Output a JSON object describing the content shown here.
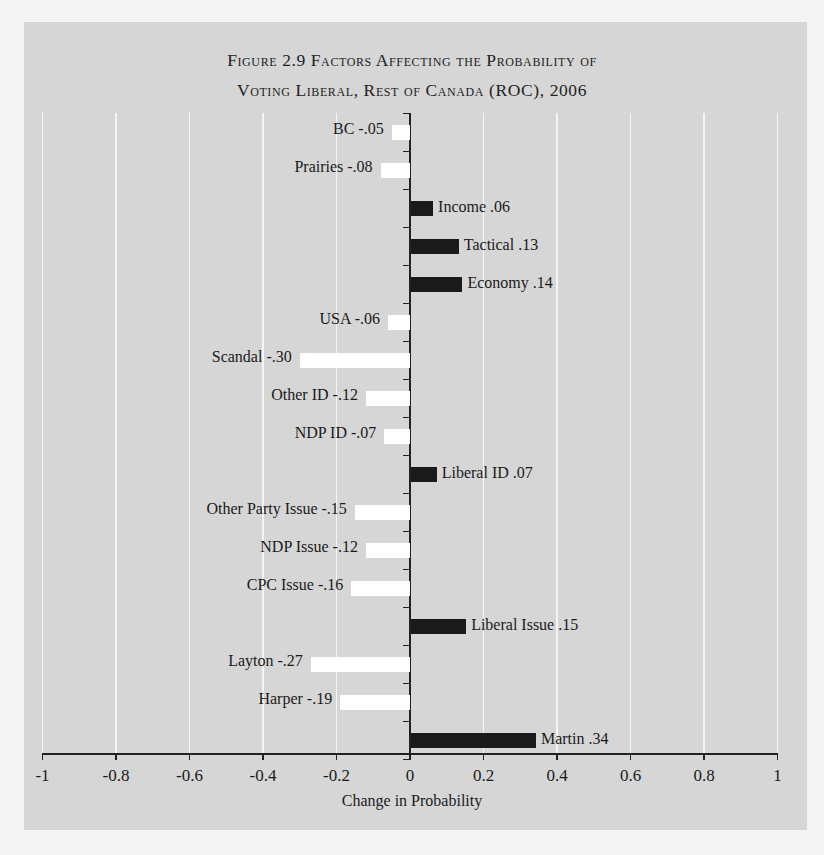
{
  "chart_data": {
    "type": "bar",
    "orientation": "horizontal",
    "title_lines": [
      "Figure 2.9 Factors Affecting the Probability of",
      "Voting Liberal, Rest of Canada (ROC), 2006"
    ],
    "xlabel": "Change in Probability",
    "ylabel": "",
    "xlim": [
      -1,
      1
    ],
    "x_ticks": [
      "-1",
      "-0.8",
      "-0.6",
      "-0.4",
      "-0.2",
      "0",
      "0.2",
      "0.4",
      "0.6",
      "0.8",
      "1"
    ],
    "grid": true,
    "legend": null,
    "colors": {
      "positive": "#1a1a1a",
      "negative": "#ffffff",
      "background": "#d6d6d6"
    },
    "categories": [
      "BC",
      "Prairies",
      "Income",
      "Tactical",
      "Economy",
      "USA",
      "Scandal",
      "Other ID",
      "NDP ID",
      "Liberal ID",
      "Other Party Issue",
      "NDP Issue",
      "CPC Issue",
      "Liberal Issue",
      "Layton",
      "Harper",
      "Martin"
    ],
    "values": [
      -0.05,
      -0.08,
      0.06,
      0.13,
      0.14,
      -0.06,
      -0.3,
      -0.12,
      -0.07,
      0.07,
      -0.15,
      -0.12,
      -0.16,
      0.15,
      -0.27,
      -0.19,
      0.34
    ],
    "labels": [
      "BC -.05",
      "Prairies -.08",
      "Income .06",
      "Tactical .13",
      "Economy .14",
      "USA -.06",
      "Scandal -.30",
      "Other ID -.12",
      "NDP ID -.07",
      "Liberal ID .07",
      "Other Party Issue -.15",
      "NDP Issue -.12",
      "CPC Issue -.16",
      "Liberal Issue .15",
      "Layton -.27",
      "Harper -.19",
      "Martin .34"
    ]
  }
}
